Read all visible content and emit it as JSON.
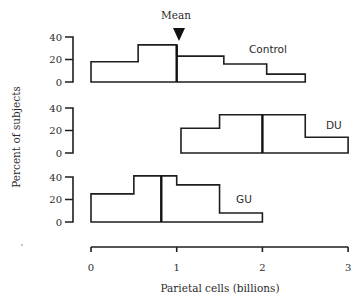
{
  "chart_data": {
    "type": "histogram-panels",
    "title": "",
    "annotation": "Mean",
    "xlabel": "Parietal cells (billions)",
    "ylabel": "Percent of subjects",
    "xlim": [
      0,
      3
    ],
    "xticks": [
      "0",
      "1",
      "2",
      "3"
    ],
    "ylim": [
      0,
      40
    ],
    "yticks": [
      "0",
      "20",
      "40"
    ],
    "grid": false,
    "panels": [
      {
        "name": "Control",
        "bin_edges": [
          0.0,
          0.55,
          1.0,
          1.55,
          2.05,
          2.5
        ],
        "values": [
          18,
          33,
          23,
          16,
          7
        ],
        "mean": 1.0
      },
      {
        "name": "DU",
        "bin_edges": [
          1.05,
          1.5,
          2.5,
          3.0
        ],
        "values": [
          22,
          34,
          14
        ],
        "mean": 2.0
      },
      {
        "name": "GU",
        "bin_edges": [
          0.0,
          0.5,
          1.0,
          1.5,
          2.0
        ],
        "values": [
          25,
          41,
          33,
          8
        ],
        "mean": 0.82
      }
    ]
  },
  "labels": {
    "mean": "Mean",
    "xlabel": "Parietal cells (billions)",
    "ylabel": "Percent of subjects",
    "control": "Control",
    "du": "DU",
    "gu": "GU"
  }
}
